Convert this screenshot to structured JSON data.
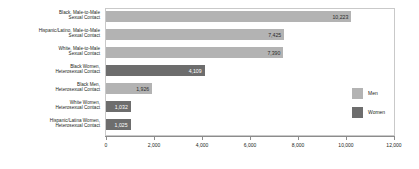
{
  "chart_data": {
    "type": "bar",
    "orientation": "horizontal",
    "title": "",
    "xlabel": "",
    "ylabel": "",
    "xlim": [
      0,
      12000
    ],
    "xticks": [
      "0",
      "2,000",
      "4,000",
      "6,000",
      "8,000",
      "10,000",
      "12,000"
    ],
    "xtick_values": [
      0,
      2000,
      4000,
      6000,
      8000,
      10000,
      12000
    ],
    "grid": false,
    "legend_position": "right",
    "categories": [
      "Black, Male-to-Male Sexual Contact",
      "Hispanic/Latino, Male-to-Male Sexual Contact",
      "White, Male-to-Male Sexual Contact",
      "Black Women, Heterosexual Contact",
      "Black Men, Heterosexual Contact",
      "White Women, Heterosexual Contact",
      "Hispanic/Latina Women, Heterosexual Contact"
    ],
    "values": [
      10223,
      7425,
      7390,
      4109,
      1926,
      1032,
      1025
    ],
    "value_labels": [
      "10,223",
      "7,425",
      "7,390",
      "4,109",
      "1,926",
      "1,032",
      "1,025"
    ],
    "groups": [
      "Men",
      "Men",
      "Men",
      "Women",
      "Men",
      "Women",
      "Women"
    ],
    "series": [
      {
        "name": "Men",
        "color": "#b3b3b3",
        "points": [
          {
            "category": "Black, Male-to-Male Sexual Contact",
            "value": 10223,
            "label": "10,223"
          },
          {
            "category": "Hispanic/Latino, Male-to-Male Sexual Contact",
            "value": 7425,
            "label": "7,425"
          },
          {
            "category": "White, Male-to-Male Sexual Contact",
            "value": 7390,
            "label": "7,390"
          },
          {
            "category": "Black Men, Heterosexual Contact",
            "value": 1926,
            "label": "1,926"
          }
        ]
      },
      {
        "name": "Women",
        "color": "#6d6d6d",
        "points": [
          {
            "category": "Black Women, Heterosexual Contact",
            "value": 4109,
            "label": "4,109"
          },
          {
            "category": "White Women, Heterosexual Contact",
            "value": 1032,
            "label": "1,032"
          },
          {
            "category": "Hispanic/Latina Women, Heterosexual Contact",
            "value": 1025,
            "label": "1,025"
          }
        ]
      }
    ]
  },
  "category_labels": [
    {
      "line1": "Black, Male-to-Male",
      "line2": "Sexual Contact"
    },
    {
      "line1": "Hispanic/Latino, Male-to-Male",
      "line2": "Sexual Contact"
    },
    {
      "line1": "White, Male-to-Male",
      "line2": "Sexual Contact"
    },
    {
      "line1": "Black Women,",
      "line2": "Heterosexual Contact"
    },
    {
      "line1": "Black Men,",
      "line2": "Heterosexual Contact"
    },
    {
      "line1": "White Women,",
      "line2": "Heterosexual Contact"
    },
    {
      "line1": "Hispanic/Latina Women,",
      "line2": "Heterosexual Contact"
    }
  ],
  "bars": [
    {
      "label": "10,223",
      "group": "Men"
    },
    {
      "label": "7,425",
      "group": "Men"
    },
    {
      "label": "7,390",
      "group": "Men"
    },
    {
      "label": "4,109",
      "group": "Women"
    },
    {
      "label": "1,926",
      "group": "Men"
    },
    {
      "label": "1,032",
      "group": "Women"
    },
    {
      "label": "1,025",
      "group": "Women"
    }
  ],
  "xticks": [
    {
      "label": "0"
    },
    {
      "label": "2,000"
    },
    {
      "label": "4,000"
    },
    {
      "label": "6,000"
    },
    {
      "label": "8,000"
    },
    {
      "label": "10,000"
    },
    {
      "label": "12,000"
    }
  ],
  "legend": {
    "items": [
      {
        "label": "Men",
        "color": "#b3b3b3"
      },
      {
        "label": "Women",
        "color": "#6d6d6d"
      }
    ]
  },
  "colors": {
    "men": "#b3b3b3",
    "women": "#6d6d6d",
    "axis": "#8c8c8c",
    "frame": "#c9c9c9",
    "text": "#231f20"
  }
}
